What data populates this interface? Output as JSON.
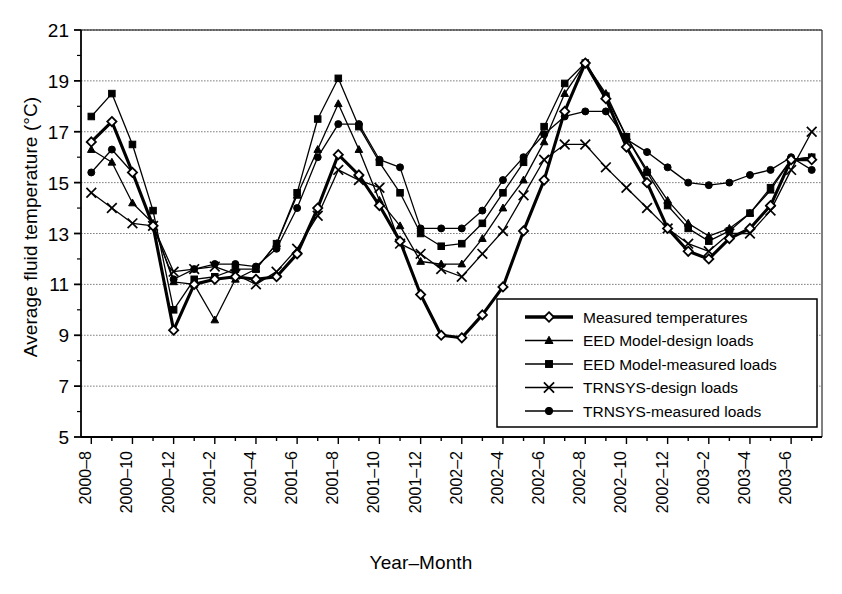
{
  "chart_data": {
    "type": "line",
    "title": "",
    "xlabel": "Year–Month",
    "ylabel": "Average fluid temperature (°C)",
    "ylim": [
      5,
      21
    ],
    "ytick_step": 2,
    "yticks": [
      5,
      7,
      9,
      11,
      13,
      15,
      17,
      19,
      21
    ],
    "grid": true,
    "legend_position": "inside-bottom-right",
    "x": [
      "2000-8",
      "2000-9",
      "2000-10",
      "2000-11",
      "2000-12",
      "2001-1",
      "2001-2",
      "2001-3",
      "2001-4",
      "2001-5",
      "2001-6",
      "2001-7",
      "2001-8",
      "2001-9",
      "2001-10",
      "2001-11",
      "2001-12",
      "2002-1",
      "2002-2",
      "2002-3",
      "2002-4",
      "2002-5",
      "2002-6",
      "2002-7",
      "2002-8",
      "2002-9",
      "2002-10",
      "2002-11",
      "2002-12",
      "2003-1",
      "2003-2",
      "2003-3",
      "2003-4",
      "2003-5",
      "2003-6",
      "2003-7"
    ],
    "xtick_labels": [
      "2000–8",
      "",
      "2000–10",
      "",
      "2000–12",
      "",
      "2001–2",
      "",
      "2001–4",
      "",
      "2001–6",
      "",
      "2001–8",
      "",
      "2001–10",
      "",
      "2001–12",
      "",
      "2002–2",
      "",
      "2002–4",
      "",
      "2002–6",
      "",
      "2002–8",
      "",
      "2002–10",
      "",
      "2002–12",
      "",
      "2003–2",
      "",
      "2003–4",
      "",
      "2003–6",
      ""
    ],
    "series": [
      {
        "name": "Measured temperatures",
        "marker": "open-diamond",
        "linewidth": "thick",
        "values": [
          16.6,
          17.4,
          15.4,
          13.3,
          9.2,
          11.0,
          11.2,
          11.3,
          11.2,
          11.3,
          12.2,
          14.0,
          16.1,
          15.3,
          14.1,
          12.7,
          10.6,
          9.0,
          8.9,
          9.8,
          10.9,
          13.1,
          15.1,
          17.8,
          19.7,
          18.3,
          16.4,
          15.0,
          13.2,
          12.3,
          12.0,
          12.8,
          13.2,
          14.1,
          15.9,
          15.9
        ]
      },
      {
        "name": "EED Model-design loads",
        "marker": "filled-triangle",
        "linewidth": "thin",
        "values": [
          16.3,
          15.8,
          14.2,
          13.4,
          11.1,
          11.0,
          9.6,
          11.2,
          11.6,
          12.6,
          14.5,
          16.3,
          18.1,
          16.3,
          14.3,
          13.3,
          11.9,
          11.8,
          11.8,
          12.8,
          14.0,
          15.1,
          16.6,
          18.5,
          19.7,
          18.5,
          16.8,
          15.5,
          14.3,
          13.4,
          12.9,
          13.2,
          13.8,
          14.7,
          15.9,
          16.0
        ]
      },
      {
        "name": "EED Model-measured loads",
        "marker": "filled-square",
        "linewidth": "thin",
        "values": [
          17.6,
          18.5,
          16.5,
          13.9,
          10.0,
          11.2,
          11.3,
          11.6,
          11.6,
          12.6,
          14.6,
          17.5,
          19.1,
          17.2,
          15.8,
          14.6,
          13.0,
          12.5,
          12.6,
          13.4,
          14.6,
          15.8,
          17.2,
          18.9,
          19.7,
          18.4,
          16.8,
          15.4,
          14.1,
          13.2,
          12.7,
          13.1,
          13.8,
          14.8,
          15.9,
          16.0
        ]
      },
      {
        "name": "TRNSYS-design loads",
        "marker": "cross",
        "linewidth": "thin",
        "values": [
          14.6,
          14.0,
          13.4,
          13.3,
          11.5,
          11.6,
          11.7,
          11.4,
          11.0,
          11.5,
          12.4,
          13.7,
          15.5,
          15.1,
          14.8,
          12.6,
          12.2,
          11.6,
          11.3,
          12.2,
          13.1,
          14.5,
          15.9,
          16.5,
          16.5,
          15.6,
          14.8,
          14.0,
          13.2,
          12.6,
          12.3,
          13.0,
          13.0,
          13.9,
          15.5,
          17.0
        ]
      },
      {
        "name": "TRNSYS-measured loads",
        "marker": "filled-circle",
        "linewidth": "thin",
        "values": [
          15.4,
          16.3,
          15.4,
          13.3,
          11.2,
          11.6,
          11.8,
          11.8,
          11.7,
          12.4,
          14.0,
          16.0,
          17.3,
          17.3,
          15.9,
          15.6,
          13.2,
          13.2,
          13.2,
          13.9,
          15.1,
          16.0,
          16.9,
          17.6,
          17.8,
          17.8,
          16.7,
          16.2,
          15.6,
          15.0,
          14.9,
          15.0,
          15.3,
          15.5,
          16.0,
          15.5
        ]
      }
    ]
  },
  "legend": {
    "entries": [
      {
        "label": "Measured temperatures"
      },
      {
        "label": "EED Model-design loads"
      },
      {
        "label": "EED Model-measured loads"
      },
      {
        "label": "TRNSYS-design loads"
      },
      {
        "label": "TRNSYS-measured loads"
      }
    ]
  },
  "colors": {
    "line": "#000000",
    "grid": "#808080",
    "axis": "#000000",
    "background": "#ffffff"
  }
}
